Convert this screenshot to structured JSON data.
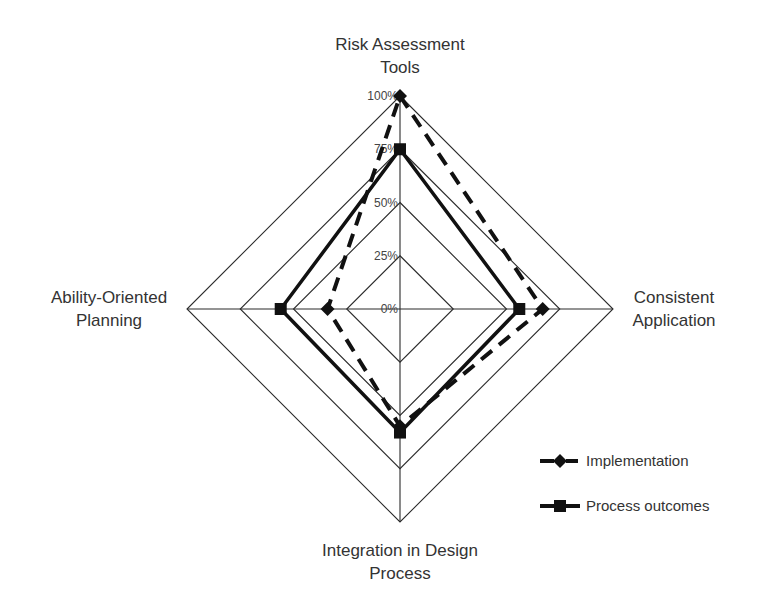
{
  "chart_data": {
    "type": "radar",
    "title": "",
    "axes": [
      {
        "label_lines": [
          "Risk Assessment",
          "Tools"
        ],
        "position": "top"
      },
      {
        "label_lines": [
          "Consistent",
          "Application"
        ],
        "position": "right"
      },
      {
        "label_lines": [
          "Integration in Design",
          "Process"
        ],
        "position": "bottom"
      },
      {
        "label_lines": [
          "Ability-Oriented",
          "Planning"
        ],
        "position": "left"
      }
    ],
    "categories": [
      "Risk Assessment Tools",
      "Consistent Application",
      "Integration in Design Process",
      "Ability-Oriented Planning"
    ],
    "range": [
      0,
      100
    ],
    "ticks": [
      0,
      25,
      50,
      75,
      100
    ],
    "tick_labels": [
      "0%",
      "25%",
      "50%",
      "75%",
      "100%"
    ],
    "grid": true,
    "legend_position": "bottom-right",
    "series": [
      {
        "name": "Implementation",
        "values": [
          100,
          67,
          55,
          34
        ],
        "line_style": "dashed",
        "marker": "diamond",
        "color": "#111111"
      },
      {
        "name": "Process outcomes",
        "values": [
          75,
          56,
          58,
          56
        ],
        "line_style": "solid",
        "marker": "square",
        "color": "#111111"
      }
    ]
  }
}
